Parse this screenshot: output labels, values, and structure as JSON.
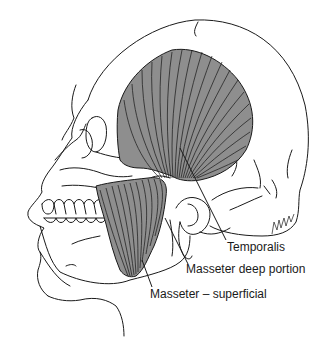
{
  "figure": {
    "colors": {
      "muscle_fill": "#8e8e8e",
      "line": "#1a1a1a",
      "background": "#ffffff"
    },
    "labels": [
      {
        "id": "temporalis",
        "text": "Temporalis"
      },
      {
        "id": "masseter-deep",
        "text": "Masseter deep portion"
      },
      {
        "id": "masseter-superficial",
        "text": "Masseter – superficial"
      }
    ],
    "signature": "BATH/KA"
  }
}
